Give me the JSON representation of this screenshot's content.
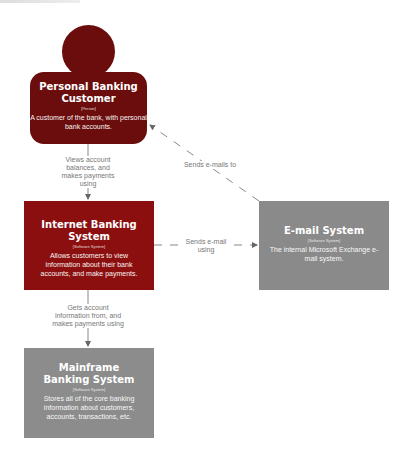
{
  "diagram": {
    "colors": {
      "person": "#6b0d0d",
      "internal_system": "#8b0f0f",
      "external_system": "#8a8a8a",
      "edge": "#888888",
      "edge_label": "#777777"
    },
    "nodes": {
      "customer": {
        "title": "Personal Banking Customer",
        "tag": "[Person]",
        "description": "A customer of the bank, with personal bank accounts."
      },
      "internet_banking": {
        "title": "Internet Banking System",
        "tag": "[Software System]",
        "description": "Allows customers to view information about their bank accounts, and make payments."
      },
      "email": {
        "title": "E-mail System",
        "tag": "[Software System]",
        "description": "The internal Microsoft Exchange e-mail system."
      },
      "mainframe": {
        "title": "Mainframe Banking System",
        "tag": "[Software System]",
        "description": "Stores all of the core banking information about customers, accounts, transactions, etc."
      }
    },
    "edges": [
      {
        "from": "customer",
        "to": "internet_banking",
        "label": "Views account balances, and makes payments using"
      },
      {
        "from": "internet_banking",
        "to": "email",
        "label": "Sends e-mail using"
      },
      {
        "from": "email",
        "to": "customer",
        "label": "Sends e-mails to"
      },
      {
        "from": "internet_banking",
        "to": "mainframe",
        "label": "Gets account information from, and makes payments using"
      }
    ]
  }
}
